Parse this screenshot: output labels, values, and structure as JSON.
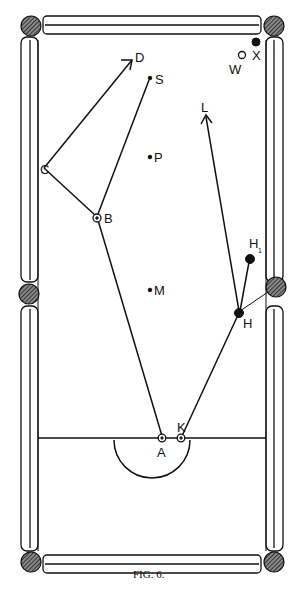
{
  "figure": {
    "caption": "FIG. 6."
  },
  "points": {
    "D": {
      "label": "D",
      "x": 135,
      "y": 58
    },
    "S": {
      "label": "S",
      "x": 150,
      "y": 78
    },
    "W": {
      "label": "W",
      "x": 242,
      "y": 55
    },
    "X": {
      "label": "X",
      "x": 256,
      "y": 42
    },
    "L": {
      "label": "L",
      "x": 206,
      "y": 116
    },
    "C": {
      "label": "C",
      "x": 44,
      "y": 168
    },
    "P": {
      "label": "P",
      "x": 150,
      "y": 157
    },
    "B": {
      "label": "B",
      "x": 97,
      "y": 218
    },
    "H1": {
      "label": "H",
      "sub": "1",
      "x": 250,
      "y": 259
    },
    "M": {
      "label": "M",
      "x": 150,
      "y": 290
    },
    "H": {
      "label": "H",
      "x": 239,
      "y": 313
    },
    "A": {
      "label": "A",
      "x": 162,
      "y": 438
    },
    "K": {
      "label": "K",
      "x": 181,
      "y": 438
    }
  },
  "paths": [
    {
      "name": "A-B",
      "from": "A",
      "to": "B"
    },
    {
      "name": "B-C",
      "from": "B",
      "to": "C"
    },
    {
      "name": "C-D",
      "from": "C",
      "to": "D",
      "arrow": true
    },
    {
      "name": "B-S",
      "from": "B",
      "to": "S"
    },
    {
      "name": "K-H",
      "from": "K",
      "to": "H"
    },
    {
      "name": "H-L",
      "from": "H",
      "to": "L",
      "arrow": true
    },
    {
      "name": "H-H1",
      "from": "H",
      "to": "H1"
    },
    {
      "name": "H-pocket",
      "from": "H",
      "to": "right-middle-pocket"
    }
  ],
  "pockets": [
    "top-left",
    "top-right",
    "middle-left",
    "middle-right",
    "bottom-left",
    "bottom-right"
  ],
  "colors": {
    "ink": "#111111",
    "paper": "#ffffff"
  }
}
